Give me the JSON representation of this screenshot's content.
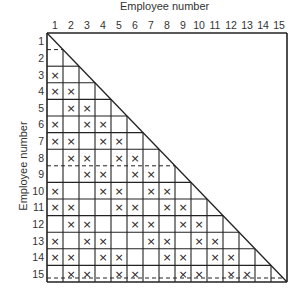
{
  "title": "Employee number",
  "xlabel": "Employee number",
  "ylabel": "Employee number",
  "size": 15,
  "column_labels": [
    "1",
    "2",
    "3",
    "4",
    "5",
    "6",
    "7",
    "8",
    "9",
    "10",
    "11",
    "12",
    "13",
    "14",
    "15"
  ],
  "row_labels": [
    "1",
    "2",
    "3",
    "4",
    "5",
    "6",
    "7",
    "8",
    "9",
    "10",
    "11",
    "12",
    "13",
    "14",
    "15"
  ],
  "mark_symbol": "×",
  "dashed_separators_after_rows": [
    1,
    8
  ],
  "marks": [
    {
      "row": 3,
      "cols": [
        1
      ]
    },
    {
      "row": 4,
      "cols": [
        1,
        2
      ]
    },
    {
      "row": 5,
      "cols": [
        2,
        3
      ]
    },
    {
      "row": 6,
      "cols": [
        1,
        3,
        4
      ]
    },
    {
      "row": 7,
      "cols": [
        1,
        2,
        4,
        5
      ]
    },
    {
      "row": 8,
      "cols": [
        2,
        3,
        5,
        6
      ]
    },
    {
      "row": 9,
      "cols": [
        3,
        4,
        6,
        7
      ]
    },
    {
      "row": 10,
      "cols": [
        1,
        4,
        5,
        7,
        8
      ]
    },
    {
      "row": 11,
      "cols": [
        1,
        2,
        5,
        6,
        8,
        9
      ]
    },
    {
      "row": 12,
      "cols": [
        2,
        3,
        6,
        7,
        9,
        10
      ]
    },
    {
      "row": 13,
      "cols": [
        1,
        3,
        4,
        7,
        8,
        10,
        11
      ]
    },
    {
      "row": 14,
      "cols": [
        1,
        2,
        4,
        5,
        8,
        9,
        11,
        12
      ]
    },
    {
      "row": 15,
      "cols": [
        2,
        3,
        5,
        6,
        9,
        10,
        12,
        13
      ]
    }
  ],
  "colors": {
    "line": "#222222",
    "text": "#333333"
  }
}
